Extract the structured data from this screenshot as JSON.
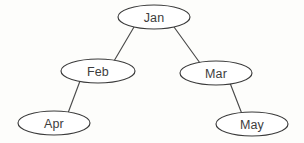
{
  "diagram": {
    "type": "binary-tree",
    "background_color": "#fdfdfb",
    "node_fill_color": "#ffffff",
    "node_stroke_color": "#3a3a3a",
    "edge_stroke_color": "#4a4a4a",
    "label_color": "#3d3d3d",
    "nodes": [
      {
        "id": "jan",
        "label": "Jan",
        "cx": 154,
        "cy": 17,
        "rx": 36,
        "ry": 12
      },
      {
        "id": "feb",
        "label": "Feb",
        "cx": 98,
        "cy": 71,
        "rx": 37,
        "ry": 12
      },
      {
        "id": "mar",
        "label": "Mar",
        "cx": 216,
        "cy": 73,
        "rx": 36,
        "ry": 12
      },
      {
        "id": "apr",
        "label": "Apr",
        "cx": 54,
        "cy": 123,
        "rx": 36,
        "ry": 12
      },
      {
        "id": "may",
        "label": "May",
        "cx": 252,
        "cy": 124,
        "rx": 36,
        "ry": 12
      }
    ],
    "edges": [
      {
        "id": "jan-feb",
        "from": "Jan",
        "to": "Feb",
        "x1": 134,
        "y1": 27,
        "x2": 114,
        "y2": 61
      },
      {
        "id": "jan-mar",
        "from": "Jan",
        "to": "Mar",
        "x1": 174,
        "y1": 27,
        "x2": 200,
        "y2": 63
      },
      {
        "id": "feb-apr",
        "from": "Feb",
        "to": "Apr",
        "x1": 80,
        "y1": 81,
        "x2": 68,
        "y2": 113
      },
      {
        "id": "mar-may",
        "from": "Mar",
        "to": "May",
        "x1": 230,
        "y1": 83,
        "x2": 242,
        "y2": 114
      }
    ]
  }
}
